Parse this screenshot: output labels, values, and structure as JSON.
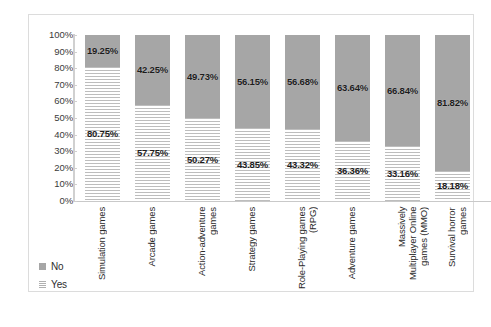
{
  "chart_data": {
    "type": "bar",
    "subtype": "100% stacked column",
    "title": "",
    "xlabel": "",
    "ylabel": "",
    "ylim": [
      0,
      100
    ],
    "ytick_labels": [
      "100%",
      "90%",
      "80%",
      "70%",
      "60%",
      "50%",
      "40%",
      "30%",
      "20%",
      "10%",
      "0%"
    ],
    "ytick_values": [
      100,
      90,
      80,
      70,
      60,
      50,
      40,
      30,
      20,
      10,
      0
    ],
    "grid": false,
    "legend_position": "bottom-left",
    "categories": [
      "Simulation games",
      "Arcade games",
      "Action-adventure games",
      "Strategy games",
      "Role-Playing games (RPG)",
      "Adventure games",
      "Massively Multiplayer Online games (MMO)",
      "Survival horror games"
    ],
    "series": [
      {
        "name": "No",
        "color": "#a6a6a6",
        "pattern": "solid",
        "values": [
          19.25,
          42.25,
          49.73,
          56.15,
          56.68,
          63.64,
          66.84,
          81.82
        ],
        "labels": [
          "19.25%",
          "42.25%",
          "49.73%",
          "56.15%",
          "56.68%",
          "63.64%",
          "66.84%",
          "81.82%"
        ]
      },
      {
        "name": "Yes",
        "color": "#ffffff",
        "pattern": "horizontal-stripes",
        "values": [
          80.75,
          57.75,
          50.27,
          43.85,
          43.32,
          36.36,
          33.16,
          18.18
        ],
        "labels": [
          "80.75%",
          "57.75%",
          "50.27%",
          "43.85%",
          "43.32%",
          "36.36%",
          "33.16%",
          "18.18%"
        ]
      }
    ]
  },
  "legend": {
    "items": [
      {
        "label": "No",
        "swatch": "solid-gray-swatch"
      },
      {
        "label": "Yes",
        "swatch": "striped-swatch"
      }
    ]
  },
  "colors": {
    "bar_no": "#a6a6a6",
    "bar_yes_stripe": "#bdbdbd",
    "frame": "#dcdcdc",
    "axis": "#cfcfcf",
    "text": "#1c1c1c"
  }
}
